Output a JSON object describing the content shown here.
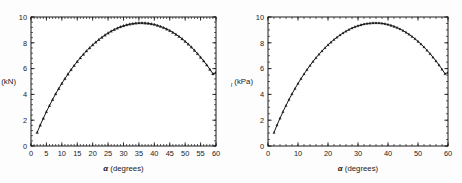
{
  "figure": {
    "background_color": "#fdfdfd",
    "curve_color": "#1a1a1a",
    "axis_color": "#1a1a1a"
  },
  "chart_data": [
    {
      "type": "line",
      "panel": "left",
      "title": "",
      "subtitle": "",
      "xlabel_symbol": "α",
      "xlabel_unit": " (degrees)",
      "ylabel_symbol": "E",
      "ylabel_unit": " (kN)",
      "ylabel_subscript": "",
      "xlim": [
        0,
        60
      ],
      "ylim": [
        0,
        10
      ],
      "xticks": [
        0,
        5,
        10,
        15,
        20,
        25,
        30,
        35,
        40,
        45,
        50,
        55,
        60
      ],
      "xticklabels": [
        "0",
        "5",
        "10",
        "15",
        "20",
        "25",
        "30",
        "35",
        "40",
        "45",
        "50",
        "55",
        "60"
      ],
      "yticks": [
        0,
        2,
        4,
        6,
        8,
        10
      ],
      "yticklabels": [
        "0",
        "2",
        "4",
        "6",
        "8",
        "10"
      ],
      "x_minor_step": 1,
      "y_minor_step": 0.4,
      "grid": false,
      "legend": null,
      "marker": "triangle",
      "x": [
        2,
        3,
        4,
        5,
        6,
        7,
        8,
        9,
        10,
        11,
        12,
        13,
        14,
        15,
        16,
        17,
        18,
        19,
        20,
        21,
        22,
        23,
        24,
        25,
        26,
        27,
        28,
        29,
        30,
        31,
        32,
        33,
        34,
        35,
        36,
        37,
        38,
        39,
        40,
        41,
        42,
        43,
        44,
        45,
        46,
        47,
        48,
        49,
        50,
        51,
        52,
        53,
        54,
        55,
        56,
        57,
        58,
        59,
        60
      ],
      "y": [
        1.05,
        1.62,
        2.15,
        2.66,
        3.14,
        3.6,
        4.04,
        4.45,
        4.85,
        5.22,
        5.58,
        5.92,
        6.24,
        6.55,
        6.84,
        7.11,
        7.37,
        7.61,
        7.84,
        8.05,
        8.25,
        8.43,
        8.6,
        8.76,
        8.9,
        9.03,
        9.14,
        9.24,
        9.32,
        9.39,
        9.45,
        9.49,
        9.52,
        9.54,
        9.54,
        9.53,
        9.51,
        9.47,
        9.42,
        9.35,
        9.27,
        9.18,
        9.07,
        8.95,
        8.81,
        8.66,
        8.49,
        8.31,
        8.11,
        7.9,
        7.67,
        7.42,
        7.16,
        6.88,
        6.59,
        6.28,
        5.95,
        5.6,
        5.7
      ]
    },
    {
      "type": "line",
      "panel": "right",
      "title": "",
      "subtitle": "",
      "xlabel_symbol": "α",
      "xlabel_unit": " (degrees)",
      "ylabel_symbol": "p",
      "ylabel_subscript": "eq",
      "ylabel_unit": " (kPa)",
      "xlim": [
        0,
        60
      ],
      "ylim": [
        0,
        10
      ],
      "xticks": [
        0,
        10,
        20,
        30,
        40,
        50,
        60
      ],
      "xticklabels": [
        "0",
        "10",
        "20",
        "30",
        "40",
        "50",
        "60"
      ],
      "yticks": [
        0,
        2,
        4,
        6,
        8,
        10
      ],
      "yticklabels": [
        "0",
        "2",
        "4",
        "6",
        "8",
        "10"
      ],
      "x_minor_step": 2,
      "y_minor_step": 0.5,
      "grid": false,
      "legend": null,
      "marker": "triangle",
      "x": [
        2,
        3,
        4,
        5,
        6,
        7,
        8,
        9,
        10,
        11,
        12,
        13,
        14,
        15,
        16,
        17,
        18,
        19,
        20,
        21,
        22,
        23,
        24,
        25,
        26,
        27,
        28,
        29,
        30,
        31,
        32,
        33,
        34,
        35,
        36,
        37,
        38,
        39,
        40,
        41,
        42,
        43,
        44,
        45,
        46,
        47,
        48,
        49,
        50,
        51,
        52,
        53,
        54,
        55,
        56,
        57,
        58,
        59,
        60
      ],
      "y": [
        1.05,
        1.62,
        2.15,
        2.66,
        3.14,
        3.6,
        4.04,
        4.45,
        4.85,
        5.22,
        5.58,
        5.92,
        6.24,
        6.55,
        6.84,
        7.11,
        7.37,
        7.61,
        7.84,
        8.05,
        8.25,
        8.43,
        8.6,
        8.76,
        8.9,
        9.03,
        9.14,
        9.24,
        9.32,
        9.39,
        9.45,
        9.49,
        9.52,
        9.54,
        9.54,
        9.53,
        9.51,
        9.47,
        9.42,
        9.35,
        9.27,
        9.18,
        9.07,
        8.95,
        8.81,
        8.66,
        8.49,
        8.31,
        8.11,
        7.9,
        7.67,
        7.42,
        7.16,
        6.88,
        6.59,
        6.28,
        5.95,
        5.6,
        5.7
      ]
    }
  ]
}
